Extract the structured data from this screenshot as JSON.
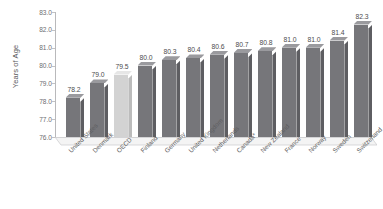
{
  "chart_data": {
    "type": "bar",
    "title": "",
    "xlabel": "",
    "ylabel": "Years of Age",
    "ylim": [
      76.0,
      83.0
    ],
    "ytick_labels": [
      "83.0",
      "82.0",
      "81.0",
      "80.0",
      "79.0",
      "78.0",
      "77.0",
      "76.0"
    ],
    "yticks": [
      83.0,
      82.0,
      81.0,
      80.0,
      79.0,
      78.0,
      77.0,
      76.0
    ],
    "grid": false,
    "legend": "none",
    "style_3d": true,
    "categories": [
      "United States",
      "Denmark",
      "OECD",
      "Finland",
      "Germany",
      "United Kingdom",
      "Netherlands",
      "Canada*",
      "New Zealand",
      "France",
      "Norway",
      "Sweden",
      "Switzerland"
    ],
    "values": [
      78.2,
      79.0,
      79.5,
      80.0,
      80.3,
      80.4,
      80.6,
      80.7,
      80.8,
      81.0,
      81.0,
      81.4,
      82.3
    ],
    "data_labels": [
      "78.2",
      "79.0",
      "79.5",
      "80.0",
      "80.3",
      "80.4",
      "80.6",
      "80.7",
      "80.8",
      "81.0",
      "81.0",
      "81.4",
      "82.3"
    ],
    "highlighted_index": 2,
    "colors": {
      "bar_front": "#76767a",
      "bar_top": "#9a9a9e",
      "bar_side": "#5e5e62",
      "highlight_front": "#d3d3d3",
      "highlight_top": "#e6e6e6",
      "highlight_side": "#bcbcbc",
      "axis": "#b9b9bb",
      "text": "#5e5e61",
      "floor": "#f2f2f2",
      "background": "#ffffff"
    }
  }
}
